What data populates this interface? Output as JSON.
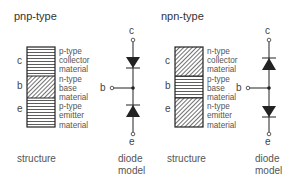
{
  "pnp": {
    "title": "pnp-type",
    "terminals": {
      "c": "c",
      "b": "b",
      "e": "e"
    },
    "layers": [
      {
        "line1": "p-type",
        "line2": "collector",
        "line3": "material",
        "pattern": "horizontal"
      },
      {
        "line1": "n-type",
        "line2": "base",
        "line3": "material",
        "pattern": "diagonal"
      },
      {
        "line1": "p-type",
        "line2": "emitter",
        "line3": "material",
        "pattern": "horizontal"
      }
    ],
    "structure_caption": "structure",
    "diode_caption_1": "diode",
    "diode_caption_2": "model",
    "diode_terminals": {
      "c": "c",
      "b": "b",
      "e": "e"
    }
  },
  "npn": {
    "title": "npn-type",
    "terminals": {
      "c": "c",
      "b": "b",
      "e": "e"
    },
    "layers": [
      {
        "line1": "n-type",
        "line2": "collector",
        "line3": "material",
        "pattern": "diagonal"
      },
      {
        "line1": "p-type",
        "line2": "base",
        "line3": "material",
        "pattern": "horizontal"
      },
      {
        "line1": "n-type",
        "line2": "emitter",
        "line3": "material",
        "pattern": "diagonal"
      }
    ],
    "structure_caption": "structure",
    "diode_caption_1": "diode",
    "diode_caption_2": "model",
    "diode_terminals": {
      "c": "c",
      "b": "b",
      "e": "e"
    }
  }
}
